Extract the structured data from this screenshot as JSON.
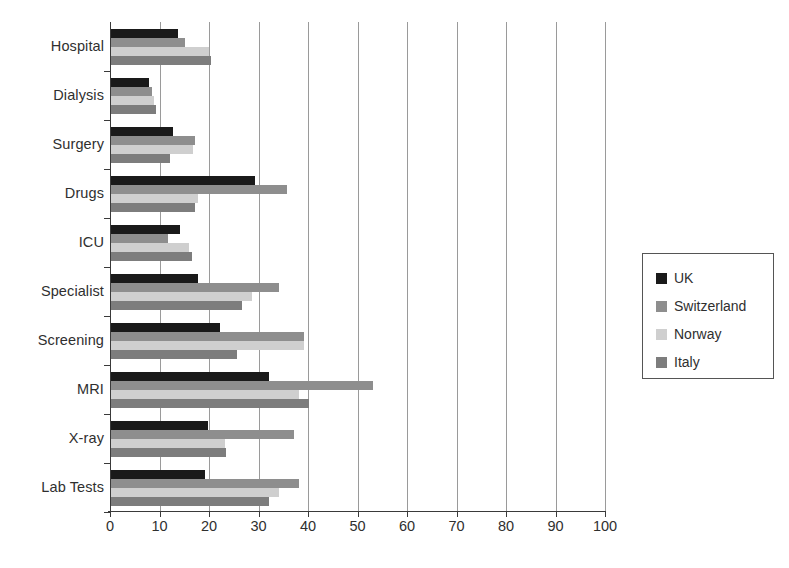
{
  "chart_data": {
    "type": "bar",
    "orientation": "horizontal",
    "title": "",
    "xlabel": "",
    "ylabel": "",
    "xlim": [
      0,
      100
    ],
    "xticks": [
      0,
      10,
      20,
      30,
      40,
      50,
      60,
      70,
      80,
      90,
      100
    ],
    "xtick_labels": [
      "0",
      "10",
      "20",
      "30",
      "40",
      "50",
      "60",
      "70",
      "80",
      "90",
      "100"
    ],
    "grid": true,
    "grid_axis": "x",
    "legend_position": "right",
    "categories": [
      "Hospital",
      "Dialysis",
      "Surgery",
      "Drugs",
      "ICU",
      "Specialist",
      "Screening",
      "MRI",
      "X-ray",
      "Lab Tests"
    ],
    "series": [
      {
        "name": "UK",
        "color": "#1a1a1a",
        "swatch_name": "uk",
        "values": [
          13.5,
          7.7,
          12.5,
          29.0,
          14.0,
          17.5,
          22.0,
          32.0,
          19.5,
          19.0
        ]
      },
      {
        "name": "Switzerland",
        "color": "#8e8e8e",
        "swatch_name": "swiss",
        "values": [
          15.0,
          8.3,
          17.0,
          35.5,
          11.5,
          34.0,
          39.0,
          53.0,
          37.0,
          38.0
        ]
      },
      {
        "name": "Norway",
        "color": "#cfcfcf",
        "swatch_name": "norway",
        "values": [
          19.8,
          8.7,
          16.5,
          17.5,
          15.8,
          28.5,
          39.0,
          38.0,
          23.0,
          34.0
        ]
      },
      {
        "name": "Italy",
        "color": "#7d7d7d",
        "swatch_name": "italy",
        "values": [
          20.3,
          9.1,
          12.0,
          17.0,
          16.4,
          26.5,
          25.5,
          40.0,
          23.2,
          32.0
        ]
      }
    ]
  },
  "legend": {
    "items": [
      {
        "label": "UK",
        "color": "#1a1a1a"
      },
      {
        "label": "Switzerland",
        "color": "#8e8e8e"
      },
      {
        "label": "Norway",
        "color": "#cfcfcf"
      },
      {
        "label": "Italy",
        "color": "#7d7d7d"
      }
    ]
  }
}
